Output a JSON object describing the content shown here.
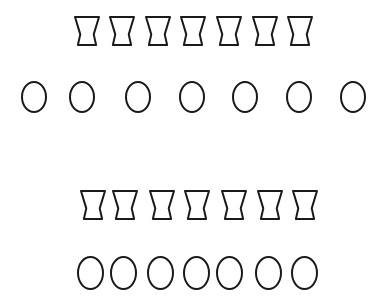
{
  "diagram": {
    "stroke_color": "#1a1a1a",
    "background": "#ffffff",
    "groups": [
      {
        "name": "top-group",
        "rows": [
          {
            "shape": "hourglass",
            "count": 7,
            "y": 17,
            "h": 28,
            "w": 24,
            "xs": [
              75,
              110,
              146,
              181,
              217,
              253,
              288
            ]
          },
          {
            "shape": "circle",
            "count": 7,
            "y": 82,
            "h": 30,
            "w": 24,
            "xs": [
              22,
              70,
              126,
              180,
              233,
              287,
              341
            ]
          }
        ]
      },
      {
        "name": "bottom-group",
        "rows": [
          {
            "shape": "hourglass",
            "count": 7,
            "y": 191,
            "h": 28,
            "w": 24,
            "xs": [
              81,
              113,
              150,
              185,
              222,
              258,
              293
            ]
          },
          {
            "shape": "circle",
            "count": 7,
            "y": 257,
            "h": 32,
            "w": 25,
            "xs": [
              78,
              111,
              148,
              184,
              217,
              256,
              292
            ]
          }
        ]
      }
    ]
  }
}
